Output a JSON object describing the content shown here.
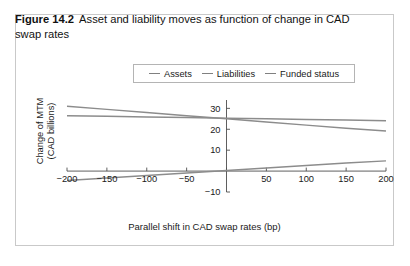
{
  "figure": {
    "label": "Figure 14.2",
    "caption": "Asset and liability moves as function of change in CAD swap rates"
  },
  "legend": {
    "position": "top-center",
    "entries": [
      {
        "label": "Assets",
        "color": "#8c8c8c"
      },
      {
        "label": "Liabilities",
        "color": "#8c8c8c"
      },
      {
        "label": "Funded status",
        "color": "#8c8c8c"
      }
    ]
  },
  "chart_data": {
    "type": "line",
    "title": "",
    "xlabel": "Parallel shift in CAD swap rates (bp)",
    "ylabel": "Change of MTM\n(CAD billions)",
    "ylabel_line1": "Change of MTM",
    "ylabel_line2": "(CAD billions)",
    "x": [
      -200,
      -150,
      -100,
      -50,
      0,
      50,
      100,
      150,
      200
    ],
    "xlim": [
      -200,
      200
    ],
    "ylim": [
      -10,
      34
    ],
    "xticks": [
      -200,
      -150,
      -100,
      -50,
      0,
      50,
      100,
      150,
      200
    ],
    "xtick_labels": [
      "−200",
      "−150",
      "−100",
      "−50",
      "",
      "50",
      "100",
      "150",
      "200"
    ],
    "yticks": [
      -10,
      10,
      20,
      30
    ],
    "ytick_labels": [
      "−10",
      "10",
      "20",
      "30"
    ],
    "grid": false,
    "series": [
      {
        "name": "Assets",
        "color": "#8c8c8c",
        "values": [
          26.5,
          26.2,
          25.9,
          25.6,
          25.3,
          25.0,
          24.7,
          24.4,
          24.1
        ]
      },
      {
        "name": "Liabilities",
        "color": "#8c8c8c",
        "values": [
          31.0,
          29.5,
          28.0,
          26.5,
          25.0,
          23.5,
          22.0,
          20.5,
          19.2
        ]
      },
      {
        "name": "Funded status",
        "color": "#8c8c8c",
        "values": [
          -4.5,
          -3.3,
          -2.1,
          -0.9,
          0.3,
          1.5,
          2.7,
          3.9,
          4.9
        ]
      }
    ]
  },
  "axes": {
    "axis_color": "#4d4d4d",
    "line_color": "#8c8c8c"
  }
}
